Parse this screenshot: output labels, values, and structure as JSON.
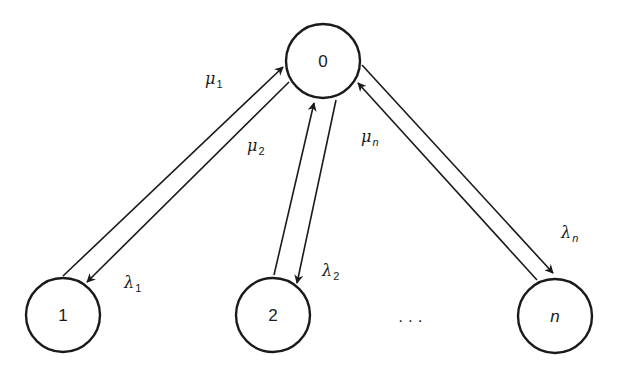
{
  "diagram": {
    "nodes": [
      {
        "id": "0",
        "label": "0",
        "cx": 323,
        "cy": 61,
        "italic": false
      },
      {
        "id": "1",
        "label": "1",
        "cx": 63,
        "cy": 315,
        "italic": false
      },
      {
        "id": "2",
        "label": "2",
        "cx": 273,
        "cy": 315,
        "italic": false
      },
      {
        "id": "n",
        "label": "n",
        "cx": 555,
        "cy": 316,
        "italic": true
      }
    ],
    "radius": 37,
    "ellipsis": "· · ·",
    "edges": [
      {
        "from": "1",
        "to": "0",
        "label_base": "μ",
        "label_sub": "1",
        "x1": 63,
        "y1": 276,
        "x2": 283,
        "y2": 67,
        "lx": 205,
        "ly": 84
      },
      {
        "from": "0",
        "to": "1",
        "label_base": "λ",
        "label_sub": "1",
        "x1": 289,
        "y1": 82,
        "x2": 87,
        "y2": 282,
        "lx": 124,
        "ly": 288
      },
      {
        "from": "2",
        "to": "0",
        "label_base": "μ",
        "label_sub": "2",
        "x1": 274,
        "y1": 275,
        "x2": 314,
        "y2": 103,
        "lx": 247,
        "ly": 151
      },
      {
        "from": "0",
        "to": "2",
        "label_base": "λ",
        "label_sub": "2",
        "x1": 336,
        "y1": 100,
        "x2": 297,
        "y2": 283,
        "lx": 322,
        "ly": 276
      },
      {
        "from": "0",
        "to": "n",
        "label_base": "λ",
        "label_sub": "n",
        "x1": 362,
        "y1": 65,
        "x2": 553,
        "y2": 273,
        "lx": 561,
        "ly": 238
      },
      {
        "from": "n",
        "to": "0",
        "label_base": "μ",
        "label_sub": "n",
        "x1": 537,
        "y1": 280,
        "x2": 358,
        "y2": 83,
        "lx": 361,
        "ly": 142
      }
    ]
  }
}
